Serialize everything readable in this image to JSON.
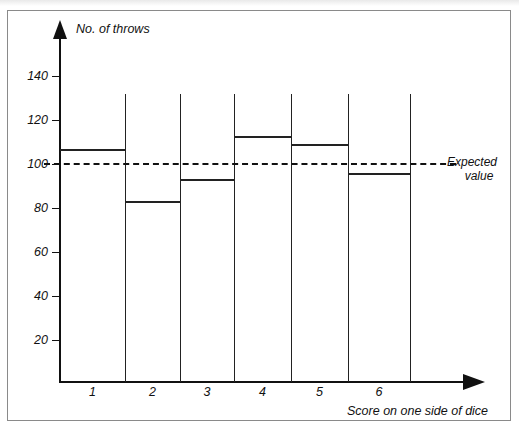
{
  "figure": {
    "y_axis_title": "No. of throws",
    "x_axis_title": "Score on one side of dice",
    "expected_label_line1": "Expected",
    "expected_label_line2": "value"
  },
  "chart_data": {
    "type": "bar",
    "title": "",
    "xlabel": "Score on one side of dice",
    "ylabel": "No. of throws",
    "categories": [
      "1",
      "2",
      "3",
      "4",
      "5",
      "6"
    ],
    "values": [
      107,
      83,
      93,
      113,
      109,
      96
    ],
    "ylim": [
      0,
      150
    ],
    "yticks": [
      20,
      40,
      60,
      80,
      100,
      120,
      140
    ],
    "ytick_labels": [
      "20",
      "40",
      "60",
      "80",
      "100",
      "120",
      "140"
    ],
    "grid": false,
    "legend": "none",
    "annotations": [
      {
        "name": "expected-value-line",
        "text": "Expected value",
        "value": 100,
        "style": "dashed-horizontal"
      }
    ],
    "colors": {
      "line": "#222222",
      "axis": "#111111",
      "background": "#ffffff",
      "frame": "#8a8a8a"
    }
  }
}
